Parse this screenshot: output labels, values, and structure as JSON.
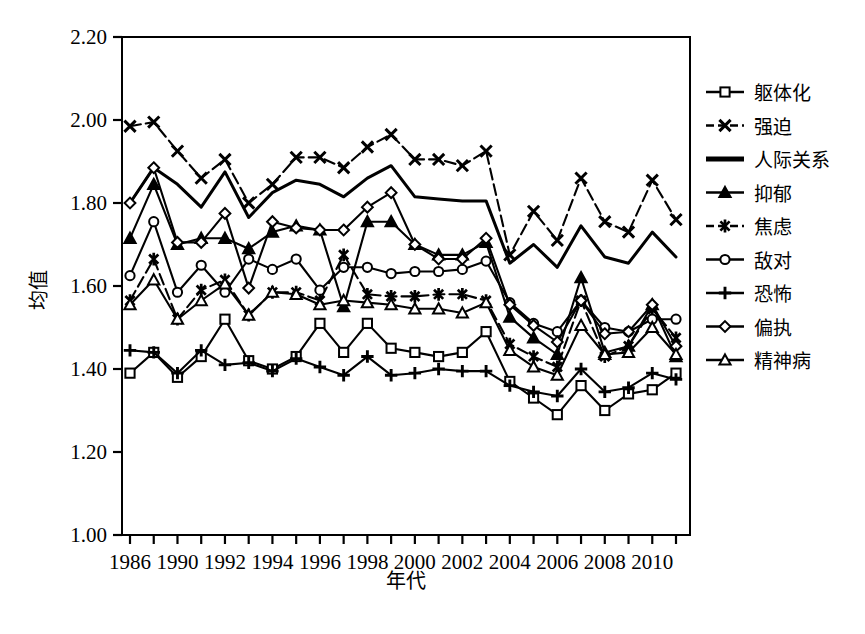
{
  "figure": {
    "caption": ""
  },
  "chart_data": {
    "type": "line",
    "title": "",
    "xlabel": "年代",
    "ylabel": "均值",
    "ylim": [
      1.0,
      2.2
    ],
    "ytick_step": 0.2,
    "ytick_labels": [
      "1.00",
      "1.20",
      "1.40",
      "1.60",
      "1.80",
      "2.00",
      "2.20"
    ],
    "ytick_values": [
      1.0,
      1.2,
      1.4,
      1.6,
      1.8,
      2.0,
      2.2
    ],
    "grid": false,
    "legend_position": "right",
    "x": [
      1986,
      1988,
      1989,
      1990,
      1991,
      1992,
      1993,
      1994,
      1995,
      1996,
      1997,
      1998,
      1999,
      2000,
      2001,
      2002,
      2003,
      2004,
      2005,
      2006,
      2007,
      2008,
      2009,
      2010
    ],
    "xtick_labels": [
      "1986",
      "",
      "1990",
      "",
      "1992",
      "",
      "1994",
      "",
      "1996",
      "",
      "1998",
      "",
      "2000",
      "",
      "2002",
      "",
      "2004",
      "",
      "2006",
      "",
      "2008",
      "",
      "2010"
    ],
    "xtick_labels_shown": [
      "1986",
      "1990",
      "1992",
      "1994",
      "1996",
      "1998",
      "2000",
      "2002",
      "2004",
      "2006",
      "2008",
      "2010"
    ],
    "series": [
      {
        "name": "躯体化",
        "marker": "square-open",
        "dash": false,
        "values": [
          1.39,
          1.44,
          1.38,
          1.43,
          1.52,
          1.42,
          1.4,
          1.43,
          1.51,
          1.44,
          1.51,
          1.45,
          1.44,
          1.43,
          1.44,
          1.49,
          1.37,
          1.33,
          1.29,
          1.36,
          1.3,
          1.34,
          1.35,
          1.39
        ]
      },
      {
        "name": "强迫",
        "marker": "x-bold",
        "dash": true,
        "values": [
          1.985,
          1.995,
          1.925,
          1.86,
          1.905,
          1.8,
          1.845,
          1.91,
          1.91,
          1.885,
          1.935,
          1.965,
          1.905,
          1.905,
          1.89,
          1.925,
          1.675,
          1.78,
          1.71,
          1.86,
          1.755,
          1.73,
          1.855,
          1.76
        ]
      },
      {
        "name": "人际关系",
        "marker": "none",
        "dash": false,
        "values": [
          1.8,
          1.885,
          1.845,
          1.79,
          1.875,
          1.765,
          1.825,
          1.855,
          1.845,
          1.815,
          1.86,
          1.89,
          1.815,
          1.81,
          1.805,
          1.805,
          1.655,
          1.7,
          1.645,
          1.745,
          1.67,
          1.655,
          1.73,
          1.67
        ]
      },
      {
        "name": "抑郁",
        "marker": "triangle-filled",
        "dash": false,
        "values": [
          1.715,
          1.845,
          1.7,
          1.715,
          1.715,
          1.69,
          1.73,
          1.745,
          1.735,
          1.55,
          1.755,
          1.755,
          1.7,
          1.675,
          1.675,
          1.705,
          1.525,
          1.475,
          1.435,
          1.62,
          1.44,
          1.455,
          1.555,
          1.43
        ]
      },
      {
        "name": "焦虑",
        "marker": "star-bold",
        "dash": true,
        "values": [
          1.565,
          1.665,
          1.52,
          1.59,
          1.615,
          1.53,
          1.585,
          1.585,
          1.565,
          1.675,
          1.58,
          1.575,
          1.575,
          1.58,
          1.58,
          1.565,
          1.46,
          1.43,
          1.405,
          1.565,
          1.43,
          1.455,
          1.545,
          1.475
        ]
      },
      {
        "name": "敌对",
        "marker": "circle-open",
        "dash": false,
        "values": [
          1.625,
          1.755,
          1.585,
          1.65,
          1.585,
          1.665,
          1.64,
          1.665,
          1.59,
          1.645,
          1.645,
          1.63,
          1.635,
          1.635,
          1.64,
          1.66,
          1.56,
          1.51,
          1.49,
          1.565,
          1.5,
          1.49,
          1.52,
          1.52
        ]
      },
      {
        "name": "恐怖",
        "marker": "plus",
        "dash": false,
        "values": [
          1.445,
          1.44,
          1.39,
          1.445,
          1.41,
          1.415,
          1.395,
          1.425,
          1.405,
          1.385,
          1.43,
          1.385,
          1.39,
          1.4,
          1.395,
          1.395,
          1.36,
          1.345,
          1.335,
          1.4,
          1.345,
          1.355,
          1.39,
          1.375
        ]
      },
      {
        "name": "偏执",
        "marker": "diamond-open",
        "dash": false,
        "values": [
          1.8,
          1.885,
          1.705,
          1.705,
          1.775,
          1.595,
          1.755,
          1.74,
          1.735,
          1.735,
          1.79,
          1.825,
          1.7,
          1.665,
          1.665,
          1.715,
          1.555,
          1.505,
          1.465,
          1.565,
          1.485,
          1.49,
          1.555,
          1.455
        ]
      },
      {
        "name": "精神病",
        "marker": "triangle-open",
        "dash": false,
        "values": [
          1.555,
          1.615,
          1.52,
          1.565,
          1.605,
          1.53,
          1.585,
          1.58,
          1.555,
          1.565,
          1.56,
          1.555,
          1.545,
          1.545,
          1.535,
          1.56,
          1.445,
          1.405,
          1.385,
          1.505,
          1.435,
          1.44,
          1.5,
          1.435
        ]
      }
    ]
  }
}
